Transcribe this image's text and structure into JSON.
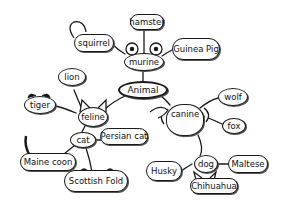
{
  "diagram": {
    "type": "mind-map",
    "style": "hand-drawn",
    "root": {
      "id": "animal",
      "label": "Animal"
    },
    "nodes": {
      "animal": {
        "label": "Animal"
      },
      "murine": {
        "label": "murine"
      },
      "hamster": {
        "label": "hamster"
      },
      "squirrel": {
        "label": "squirrel"
      },
      "guinea_pig": {
        "label": "Guinea Pig"
      },
      "feline": {
        "label": "feline"
      },
      "lion": {
        "label": "lion"
      },
      "tiger": {
        "label": "tiger"
      },
      "cat": {
        "label": "cat"
      },
      "persian_cat": {
        "label": "Persian cat"
      },
      "maine_coon": {
        "label": "Maine coon"
      },
      "scottish_fold": {
        "label": "Scottish Fold"
      },
      "canine": {
        "label": "canine"
      },
      "wolf": {
        "label": "wolf"
      },
      "fox": {
        "label": "fox"
      },
      "dog": {
        "label": "dog"
      },
      "husky": {
        "label": "Husky"
      },
      "maltese": {
        "label": "Maltese"
      },
      "chihuahua": {
        "label": "Chihuahua"
      }
    },
    "edges": [
      [
        "animal",
        "murine"
      ],
      [
        "animal",
        "feline"
      ],
      [
        "animal",
        "canine"
      ],
      [
        "murine",
        "hamster"
      ],
      [
        "murine",
        "squirrel"
      ],
      [
        "murine",
        "guinea_pig"
      ],
      [
        "feline",
        "lion"
      ],
      [
        "feline",
        "tiger"
      ],
      [
        "feline",
        "cat"
      ],
      [
        "cat",
        "persian_cat"
      ],
      [
        "cat",
        "maine_coon"
      ],
      [
        "cat",
        "scottish_fold"
      ],
      [
        "canine",
        "wolf"
      ],
      [
        "canine",
        "fox"
      ],
      [
        "canine",
        "dog"
      ],
      [
        "dog",
        "husky"
      ],
      [
        "dog",
        "maltese"
      ],
      [
        "dog",
        "chihuahua"
      ]
    ],
    "colors": {
      "ink": "#1a1a1a",
      "background": "#ffffff"
    }
  }
}
